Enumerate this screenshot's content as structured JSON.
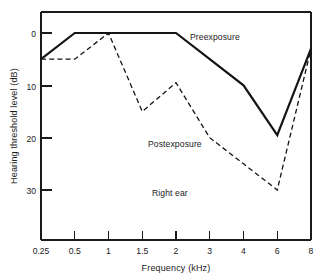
{
  "chart_data": {
    "type": "line",
    "title": "",
    "xlabel": "Frequency  (kHz)",
    "ylabel": "Hearing threshold level  (dB)",
    "categories": [
      "0.25",
      "0.5",
      "1",
      "1.5",
      "2",
      "3",
      "4",
      "6",
      "8"
    ],
    "x_tick_labels": [
      "0.25",
      "0.5",
      "1",
      "1.5",
      "2",
      "3",
      "4",
      "6",
      "8"
    ],
    "y_tick_labels": [
      "0",
      "10",
      "20",
      "30"
    ],
    "y_tick_values": [
      0,
      10,
      20,
      30
    ],
    "ylim": [
      -4,
      44
    ],
    "y_axis_inverted": true,
    "grid": false,
    "legend_position": "inline-annotations",
    "series": [
      {
        "name": "Preexposure",
        "style": "solid",
        "values": [
          5,
          0,
          0,
          0,
          0,
          5,
          10,
          19.5,
          3
        ]
      },
      {
        "name": "Postexposure",
        "style": "dashed",
        "values": [
          5,
          5,
          0,
          15,
          9.5,
          20,
          25,
          30,
          3
        ]
      }
    ],
    "annotations": [
      {
        "text": "Preexposure",
        "x_category": "2",
        "y_value": 1.5
      },
      {
        "text": "Postexposure",
        "x_category": "1.5",
        "y_value": 22.5
      },
      {
        "text": "Right ear",
        "x_category": "1.5",
        "y_value": 31.5
      }
    ],
    "notes": [
      "Right ear"
    ]
  },
  "figure": {
    "ylabel": "Hearing threshold level  (dB)",
    "xlabel": "Frequency  (kHz)",
    "preexposure_label": "Preexposure",
    "postexposure_label": "Postexposure",
    "right_ear_label": "Right ear",
    "xticks": {
      "t0": "0.25",
      "t1": "0.5",
      "t2": "1",
      "t3": "1.5",
      "t4": "2",
      "t5": "3",
      "t6": "4",
      "t7": "6",
      "t8": "8"
    },
    "yticks": {
      "t0": "0",
      "t1": "10",
      "t2": "20",
      "t3": "30"
    },
    "colors": {
      "ink": "#141414",
      "background": "#ffffff"
    }
  }
}
